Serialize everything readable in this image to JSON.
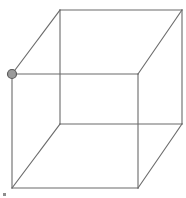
{
  "canvas": {
    "width": 186,
    "height": 198,
    "background_color": "#ffffff",
    "title": "Wireframe Cube"
  },
  "figure": {
    "name": "wireframe-cube",
    "projection": "oblique-parallel",
    "edge_color": "#6a6a6a",
    "edge_width": 1.1,
    "fill": "none"
  },
  "vertices": {
    "front_top_left": {
      "label": "front-top-left",
      "x": 12,
      "y": 74
    },
    "front_top_right": {
      "label": "front-top-right",
      "x": 138,
      "y": 74
    },
    "front_bottom_right": {
      "label": "front-bottom-right",
      "x": 138,
      "y": 188
    },
    "front_bottom_left": {
      "label": "front-bottom-left",
      "x": 12,
      "y": 188
    },
    "back_top_left": {
      "label": "back-top-left",
      "x": 60,
      "y": 10
    },
    "back_top_right": {
      "label": "back-top-right",
      "x": 182,
      "y": 10
    },
    "back_bottom_right": {
      "label": "back-bottom-right",
      "x": 182,
      "y": 124
    },
    "back_bottom_left": {
      "label": "back-bottom-left",
      "x": 60,
      "y": 124
    }
  },
  "edges": [
    {
      "name": "front-face-top",
      "from": "front_top_left",
      "to": "front_top_right",
      "path": "M12,74 L138,74"
    },
    {
      "name": "front-face-right",
      "from": "front_top_right",
      "to": "front_bottom_right",
      "path": "M138,74 L138,188"
    },
    {
      "name": "front-face-bottom",
      "from": "front_bottom_right",
      "to": "front_bottom_left",
      "path": "M138,188 L12,188"
    },
    {
      "name": "front-face-left",
      "from": "front_bottom_left",
      "to": "front_top_left",
      "path": "M12,188 L12,74"
    },
    {
      "name": "back-face-top",
      "from": "back_top_left",
      "to": "back_top_right",
      "path": "M60,10 L182,10"
    },
    {
      "name": "back-face-right",
      "from": "back_top_right",
      "to": "back_bottom_right",
      "path": "M182,10 L182,124"
    },
    {
      "name": "back-face-bottom",
      "from": "back_bottom_right",
      "to": "back_bottom_left",
      "path": "M182,124 L60,124"
    },
    {
      "name": "back-face-left",
      "from": "back_bottom_left",
      "to": "back_top_left",
      "path": "M60,124 L60,10"
    },
    {
      "name": "connector-top-left",
      "from": "front_top_left",
      "to": "back_top_left",
      "path": "M12,74 L60,10"
    },
    {
      "name": "connector-top-right",
      "from": "front_top_right",
      "to": "back_top_right",
      "path": "M138,74 L182,10"
    },
    {
      "name": "connector-bottom-right",
      "from": "front_bottom_right",
      "to": "back_bottom_right",
      "path": "M138,188 L182,124"
    },
    {
      "name": "connector-bottom-left",
      "from": "front_bottom_left",
      "to": "back_bottom_left",
      "path": "M12,188 L60,124"
    }
  ],
  "marker": {
    "name": "vertex-marker",
    "at_vertex": "front_top_left",
    "x": 12,
    "y": 74,
    "radius": 4.5,
    "fill_color": "#9a9a9a",
    "stroke_color": "#5a5a5a"
  },
  "artifact": {
    "name": "corner-speck",
    "x": 3,
    "y": 193,
    "color": "#8d8d8d"
  }
}
